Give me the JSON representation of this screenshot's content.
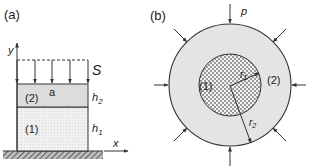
{
  "panel_a": {
    "label": "(a)",
    "axis_y": "y",
    "axis_x": "x",
    "load_label": "S",
    "interface_label": "a",
    "layer2_label": "(2)",
    "layer1_label": "(1)",
    "h2_main": "h",
    "h2_sub": "2",
    "h1_main": "h",
    "h1_sub": "1"
  },
  "panel_b": {
    "label": "(b)",
    "pressure_label": "p",
    "core_label": "(1)",
    "shell_label": "(2)",
    "r1_main": "r",
    "r1_sub": "1",
    "r2_main": "r",
    "r2_sub": "2"
  },
  "colors": {
    "stroke": "#333333",
    "layer2_fill": "#dcdcdc",
    "layer1_fill": "#efefef",
    "shell_fill": "#e4e4e4",
    "ground": "#555555"
  }
}
